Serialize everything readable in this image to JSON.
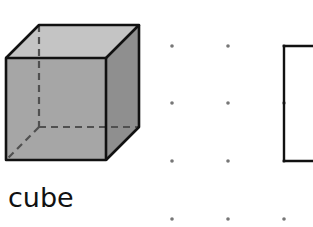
{
  "figure": {
    "label": "cube",
    "cube": {
      "front_face": {
        "x": 6,
        "y": 58,
        "size": 101
      },
      "depth_offset": {
        "dx": 33,
        "dy": -33
      },
      "colors": {
        "front": "#a3a3a3",
        "top": "#c2c2c2",
        "side": "#8e8e8e",
        "edge": "#111111",
        "hidden_edge": "#4a4a4a"
      }
    },
    "dot_grid": {
      "columns_x": [
        172,
        228,
        284
      ],
      "rows_y": [
        46,
        103,
        161,
        219
      ],
      "dot_color": "#777777",
      "dot_radius": 1.8
    },
    "partial_drawing": {
      "description": "rectangle drawn on dot grid, partially cropped at right edge",
      "points": [
        [
          313,
          46
        ],
        [
          284,
          46
        ],
        [
          284,
          161
        ],
        [
          313,
          161
        ]
      ],
      "stroke": "#111111"
    }
  }
}
